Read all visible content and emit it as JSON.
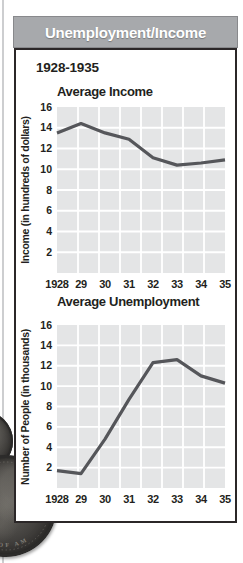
{
  "header": {
    "title": "Unemployment/Income",
    "bg_color": "#a7a9ac",
    "text_color": "#ffffff"
  },
  "panel": {
    "period_heading": "1928-1935",
    "border_color": "#2b2728"
  },
  "chart_data": [
    {
      "type": "line",
      "title": "Average Income",
      "ylabel": "Income (in hundreds of dollars)",
      "xlabel": "",
      "categories": [
        "1928",
        "29",
        "30",
        "31",
        "32",
        "33",
        "34",
        "35"
      ],
      "values": [
        13.5,
        14.4,
        13.5,
        12.9,
        11.1,
        10.4,
        10.6,
        10.9
      ],
      "ylim": [
        0,
        16
      ],
      "yticks": [
        16,
        14,
        12,
        10,
        8,
        6,
        4,
        2
      ],
      "grid": true,
      "legend": "none",
      "plot_bg": "#e4e5e6",
      "grid_color": "#ffffff",
      "line_color": "#55565a"
    },
    {
      "type": "line",
      "title": "Average Unemployment",
      "ylabel": "Number of People (in thousands)",
      "xlabel": "",
      "categories": [
        "1928",
        "29",
        "30",
        "31",
        "32",
        "33",
        "34",
        "35"
      ],
      "values": [
        1.7,
        1.4,
        4.8,
        8.7,
        12.3,
        12.6,
        11.0,
        10.3
      ],
      "ylim": [
        0,
        16
      ],
      "yticks": [
        16,
        14,
        12,
        10,
        8,
        6,
        4,
        2
      ],
      "grid": true,
      "legend": "none",
      "plot_bg": "#e4e5e6",
      "grid_color": "#ffffff",
      "line_color": "#55565a"
    }
  ],
  "decorations": {
    "coin_rim_text": "STATES OF AM"
  }
}
